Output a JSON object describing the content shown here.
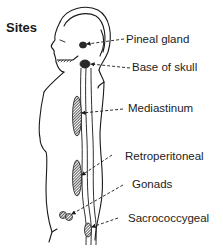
{
  "diagram": {
    "title": "Sites",
    "labels": {
      "pineal_gland": "Pineal gland",
      "base_of_skull": "Base of skull",
      "mediastinum": "Mediastinum",
      "retroperitoneal": "Retroperitoneal",
      "gonads": "Gonads",
      "sacrococcygeal": "Sacrococcygeal"
    },
    "colors": {
      "line": "#1a1a1a",
      "background": "#ffffff",
      "lesion": "#2a2a2a"
    }
  }
}
